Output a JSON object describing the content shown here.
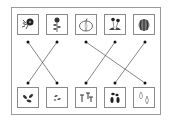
{
  "worksheet": {
    "title": "Match plants to their seeds",
    "top_items": [
      {
        "id": "top-1",
        "name": "morning-glory-flower",
        "icon": "morning-glory-icon"
      },
      {
        "id": "top-2",
        "name": "sunflower-plant",
        "icon": "sunflower-plant-icon"
      },
      {
        "id": "top-3",
        "name": "pumpkin",
        "icon": "pumpkin-icon"
      },
      {
        "id": "top-4",
        "name": "dandelion-flower",
        "icon": "dandelion-icon"
      },
      {
        "id": "top-5",
        "name": "watermelon",
        "icon": "watermelon-icon"
      }
    ],
    "bottom_items": [
      {
        "id": "bottom-1",
        "name": "leaf-seedling",
        "icon": "seedling-leaves-icon"
      },
      {
        "id": "bottom-2",
        "name": "small-seeds",
        "icon": "small-seeds-icon"
      },
      {
        "id": "bottom-3",
        "name": "dandelion-seeds",
        "icon": "dandelion-seeds-icon"
      },
      {
        "id": "bottom-4",
        "name": "dark-seeds",
        "icon": "dark-seeds-icon"
      },
      {
        "id": "bottom-5",
        "name": "pale-seeds",
        "icon": "pale-seeds-icon"
      }
    ],
    "connections": [
      {
        "from": "top-1",
        "to": "bottom-2"
      },
      {
        "from": "top-2",
        "to": "bottom-1"
      },
      {
        "from": "top-3",
        "to": "bottom-5"
      },
      {
        "from": "top-4",
        "to": "bottom-3"
      },
      {
        "from": "top-5",
        "to": "bottom-4"
      }
    ],
    "colors": {
      "line": "#555555",
      "dot": "#111111",
      "border": "#8a8a8a"
    }
  }
}
